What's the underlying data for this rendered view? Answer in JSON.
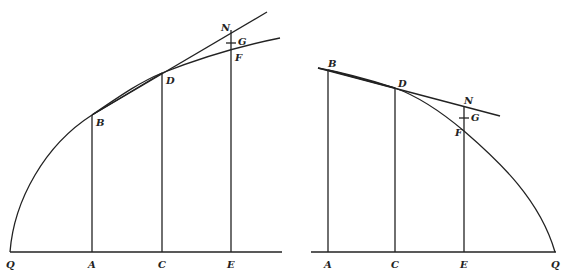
{
  "figures": [
    {
      "id": "left",
      "description": "Concave increasing curve from Q with tangent at D exceeding curve; ordinates at A, C, E",
      "labels": {
        "Q": "Q",
        "A": "A",
        "C": "C",
        "E": "E",
        "B": "B",
        "D": "D",
        "F": "F",
        "G": "G",
        "N": "N"
      }
    },
    {
      "id": "right",
      "description": "Concave decreasing curve down to Q with tangent at D; ordinates at A, C, E",
      "labels": {
        "Q": "Q",
        "A": "A",
        "C": "C",
        "E": "E",
        "B": "B",
        "D": "D",
        "F": "F",
        "G": "G",
        "N": "N"
      }
    }
  ]
}
